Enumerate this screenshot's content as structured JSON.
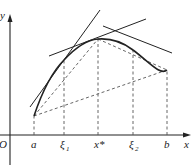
{
  "diagram": {
    "axes": {
      "x_label": "x",
      "y_label": "y",
      "origin_label": "O"
    },
    "ticks": [
      {
        "label": "a",
        "sub": "",
        "x": 34
      },
      {
        "label": "ξ",
        "sub": "1",
        "x": 64
      },
      {
        "label": "x*",
        "sub": "",
        "x": 98
      },
      {
        "label": "ξ",
        "sub": "2",
        "x": 133
      },
      {
        "label": "b",
        "sub": "",
        "x": 167
      }
    ],
    "curve_points": {
      "a": [
        34,
        116
      ],
      "xi1": [
        64,
        60
      ],
      "xstar": [
        98,
        39
      ],
      "xi2": [
        133,
        50
      ],
      "b": [
        167,
        95
      ]
    },
    "colors": {
      "line": "#222222",
      "dashed": "#555555"
    }
  }
}
